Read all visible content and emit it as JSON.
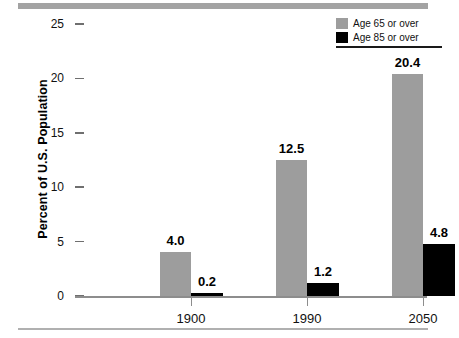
{
  "chart_data": {
    "type": "bar",
    "title": "",
    "subtitle": "",
    "xlabel": "",
    "ylabel": "Percent of U.S. Population",
    "categories": [
      "1900",
      "1990",
      "2050"
    ],
    "series": [
      {
        "name": "Age 65 or over",
        "color": "#9d9d9d",
        "values": [
          4.0,
          12.5,
          20.4
        ],
        "value_labels": [
          "4.0",
          "12.5",
          "20.4"
        ]
      },
      {
        "name": "Age 85 or over",
        "color": "#000000",
        "values": [
          0.2,
          1.2,
          4.8
        ],
        "value_labels": [
          "0.2",
          "1.2",
          "4.8"
        ]
      }
    ],
    "ylim": [
      0,
      25
    ],
    "yticks": [
      0,
      5,
      10,
      15,
      20,
      25
    ],
    "ytick_labels": [
      "0",
      "5",
      "10",
      "15",
      "20",
      "25"
    ],
    "grid": false,
    "legend_position": "top-right",
    "data_labels_shown": true
  },
  "legend": {
    "entries": [
      {
        "label": "Age 65 or over",
        "swatch": "gray"
      },
      {
        "label": "Age 85 or over",
        "swatch": "black"
      }
    ]
  },
  "axes": {
    "y_title": "Percent of U.S. Population"
  }
}
